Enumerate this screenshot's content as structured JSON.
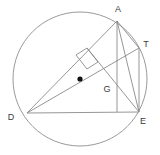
{
  "figure": {
    "name": "circle-geometry-diagram",
    "type": "geometric-construction",
    "width": 160,
    "height": 155,
    "background_color": "#ffffff",
    "stroke_color": "#8a8a8a",
    "circle_stroke_color": "#9a9a9a",
    "label_color": "#3a3a3a",
    "center_dot_color": "#111111"
  },
  "circle": {
    "name": "circumscribed-circle",
    "cx": 80,
    "cy": 79,
    "r": 67
  },
  "center_dot": {
    "name": "circle-center-dot",
    "cx": 80,
    "cy": 79,
    "r": 2.6
  },
  "points": {
    "A": {
      "label": "A",
      "x": 117,
      "y": 21,
      "label_x": 118,
      "label_y": 12
    },
    "T": {
      "label": "T",
      "x": 139,
      "y": 48,
      "label_x": 145,
      "label_y": 45
    },
    "D": {
      "label": "D",
      "x": 27,
      "y": 113,
      "label_x": 11,
      "label_y": 119
    },
    "E": {
      "label": "E",
      "x": 139,
      "y": 112,
      "label_x": 142,
      "label_y": 123
    },
    "G": {
      "label": "G",
      "x": 117,
      "y": 93,
      "label_x": 104,
      "label_y": 91
    }
  },
  "segments": [
    {
      "name": "segment-D-A",
      "x1": 27,
      "y1": 113,
      "x2": 117,
      "y2": 21
    },
    {
      "name": "segment-D-T",
      "x1": 27,
      "y1": 113,
      "x2": 139,
      "y2": 48
    },
    {
      "name": "segment-D-E",
      "x1": 27,
      "y1": 113,
      "x2": 139,
      "y2": 112
    },
    {
      "name": "segment-A-E",
      "x1": 117,
      "y1": 21,
      "x2": 117,
      "y2": 112
    },
    {
      "name": "segment-A-T",
      "x1": 117,
      "y1": 21,
      "x2": 139,
      "y2": 48
    },
    {
      "name": "segment-A-E-diagonal",
      "x1": 117,
      "y1": 21,
      "x2": 139,
      "y2": 112
    },
    {
      "name": "segment-T-E",
      "x1": 139,
      "y1": 48,
      "x2": 139,
      "y2": 112
    },
    {
      "name": "segment-G-E",
      "x1": 87,
      "y1": 48,
      "x2": 139,
      "y2": 112
    }
  ],
  "right_angle_marker": {
    "name": "right-angle-marker-at-intersection",
    "points": "76,55 87,48 98,62 87,69"
  }
}
